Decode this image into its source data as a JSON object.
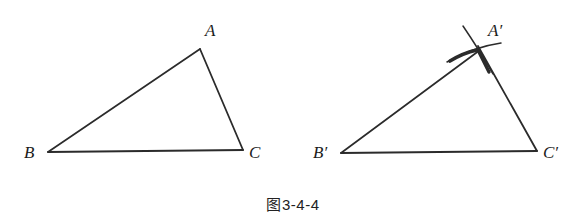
{
  "figure": {
    "caption_prefix": "图",
    "caption_number": "3-4-4",
    "background_color": "#ffffff",
    "stroke_color": "#2b2b2b",
    "label_color": "#1c1c1c"
  },
  "left_triangle": {
    "name": "triangle-abc",
    "vertices": [
      {
        "id": "A",
        "label": "A",
        "x": 200,
        "y": 49,
        "label_x": 205,
        "label_y": 22
      },
      {
        "id": "B",
        "label": "B",
        "x": 48,
        "y": 152,
        "label_x": 24,
        "label_y": 144
      },
      {
        "id": "C",
        "label": "C",
        "x": 243,
        "y": 150,
        "label_x": 249,
        "label_y": 144
      }
    ],
    "edges": [
      {
        "id": "AB",
        "label": "AB"
      },
      {
        "id": "BC",
        "label": "BC"
      },
      {
        "id": "CA",
        "label": "CA"
      }
    ]
  },
  "right_triangle": {
    "name": "triangle-a-prime-b-prime-c-prime",
    "vertices": [
      {
        "id": "A'",
        "label": "A′",
        "x": 478,
        "y": 52,
        "label_x": 488,
        "label_y": 22
      },
      {
        "id": "B'",
        "label": "B′",
        "x": 341,
        "y": 153,
        "label_x": 313,
        "label_y": 144
      },
      {
        "id": "C'",
        "label": "C′",
        "x": 537,
        "y": 151,
        "label_x": 543,
        "label_y": 144
      }
    ],
    "edges": [
      {
        "id": "A'B'",
        "label": "A′B′"
      },
      {
        "id": "B'C'",
        "label": "B′C′"
      },
      {
        "id": "C'A'",
        "label": "C′A′"
      }
    ],
    "construction_arcs": [
      {
        "id": "arc-from-b-prime",
        "label": "arc centered at B′ with radius AB"
      },
      {
        "id": "arc-from-c-prime",
        "label": "arc centered at C′ with radius AC"
      }
    ]
  }
}
